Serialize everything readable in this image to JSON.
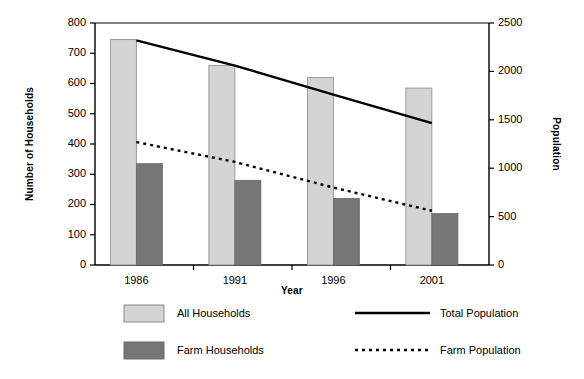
{
  "chart_data": {
    "type": "bar",
    "title": "",
    "subtitle": "",
    "xlabel": "Year",
    "ylabel": "Number of Households",
    "y2label": "Population",
    "categories": [
      "1986",
      "1991",
      "1996",
      "2001"
    ],
    "ylim": [
      0,
      800
    ],
    "yticks": [
      "0",
      "100",
      "200",
      "300",
      "400",
      "500",
      "600",
      "700",
      "800"
    ],
    "y2lim": [
      0,
      2500
    ],
    "y2ticks": [
      "0",
      "500",
      "1000",
      "1500",
      "2000",
      "2500"
    ],
    "grid": false,
    "legend_position": "bottom",
    "series": [
      {
        "name": "All Households",
        "type": "bar",
        "axis": "left",
        "color": "#d4d4d4",
        "values": [
          745,
          660,
          620,
          585
        ]
      },
      {
        "name": "Farm Households",
        "type": "bar",
        "axis": "left",
        "color": "#767676",
        "values": [
          335,
          280,
          220,
          170
        ]
      },
      {
        "name": "Total Population",
        "type": "line",
        "style": "solid",
        "axis": "right",
        "color": "#000000",
        "values": [
          2320,
          2060,
          1760,
          1465
        ]
      },
      {
        "name": "Farm Population",
        "type": "line",
        "style": "dotted",
        "axis": "right",
        "color": "#000000",
        "values": [
          1270,
          1065,
          800,
          560
        ]
      }
    ]
  },
  "legend": {
    "entries": [
      {
        "label": "All Households",
        "marker": "swatch-light"
      },
      {
        "label": "Total Population",
        "marker": "line-solid"
      },
      {
        "label": "Farm Households",
        "marker": "swatch-dark"
      },
      {
        "label": "Farm Population",
        "marker": "line-dotted"
      }
    ]
  },
  "colors": {
    "bar_light": "#d4d4d4",
    "bar_dark": "#767676",
    "bar_stroke": "#8a8a8a",
    "axis": "#000000",
    "line": "#000000",
    "background": "#ffffff"
  }
}
